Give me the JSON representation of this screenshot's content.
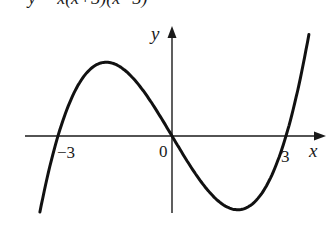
{
  "chart_data": {
    "type": "line",
    "title": "y = x(x+3)(x−3)",
    "xlabel": "x",
    "ylabel": "y",
    "x_ticks": [
      "-3",
      "0",
      "3"
    ],
    "roots": [
      -3,
      0,
      3
    ],
    "series": [
      {
        "name": "y = x(x+3)(x-3)",
        "x": [
          -4,
          -3,
          -2,
          -1.732,
          -1,
          0,
          1,
          1.732,
          2,
          3,
          3.8
        ],
        "values": [
          -28,
          0,
          10,
          10.39,
          8,
          0,
          -8,
          -10.39,
          -10,
          0,
          19.3
        ]
      }
    ],
    "grid": false,
    "legend": "none"
  },
  "labels": {
    "title_partial": "y = x(x+3)(x−3)",
    "y_axis": "y",
    "x_axis": "x",
    "origin": "0",
    "neg_three": "−3",
    "pos_three": "3"
  }
}
